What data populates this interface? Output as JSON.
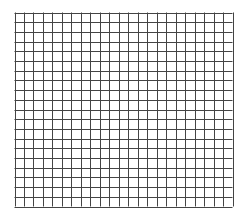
{
  "grid": {
    "columns": 23,
    "rows": 20,
    "left": 14.5,
    "top": 12.5,
    "right": 232.5,
    "bottom": 206.5,
    "line_color": "#444444",
    "background_color": "#ffffff"
  }
}
